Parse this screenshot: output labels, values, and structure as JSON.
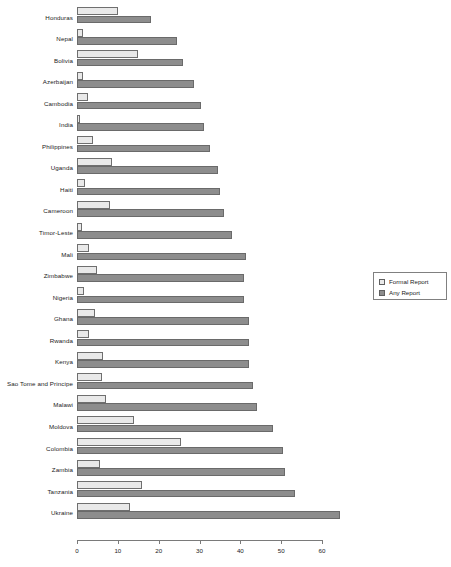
{
  "chart_data": {
    "type": "bar",
    "orientation": "horizontal",
    "title": "",
    "subtitle": "",
    "xlabel": "",
    "ylabel": "",
    "xlim": [
      0,
      65
    ],
    "xticks": [
      0,
      10,
      20,
      30,
      40,
      50,
      60
    ],
    "xtick_labels": [
      "0",
      "10",
      "20",
      "30",
      "40",
      "50",
      "60"
    ],
    "grid": false,
    "legend_position": "right-middle",
    "categories": [
      "Honduras",
      "Nepal",
      "Bolivia",
      "Azerbaijan",
      "Cambodia",
      "India",
      "Philippines",
      "Uganda",
      "Haiti",
      "Cameroon",
      "Timor-Leste",
      "Mali",
      "Zimbabwe",
      "Nigeria",
      "Ghana",
      "Rwanda",
      "Kenya",
      "Sao Tome and Principe",
      "Malawi",
      "Moldova",
      "Colombia",
      "Zambia",
      "Tanzania",
      "Ukraine"
    ],
    "series": [
      {
        "name": "Formal Report",
        "color": "#e9e9e9",
        "values": [
          10,
          1.5,
          15,
          1.5,
          2.7,
          0.8,
          4,
          8.6,
          2,
          8,
          1.2,
          3,
          5,
          1.7,
          4.4,
          3,
          6.4,
          6,
          7,
          14,
          25.5,
          5.6,
          16,
          13
        ]
      },
      {
        "name": "Any Report",
        "color": "#8d8d8d",
        "values": [
          18,
          24.5,
          26,
          28.6,
          30.4,
          31,
          32.6,
          34.5,
          35,
          36,
          38,
          41.4,
          41,
          41,
          42,
          42,
          42.2,
          43,
          44,
          48,
          50.5,
          51,
          53.4,
          64.5
        ]
      }
    ]
  },
  "legend": {
    "items": [
      {
        "label": "Formal Report",
        "swatch": "light-gray-square"
      },
      {
        "label": "Any Report",
        "swatch": "dark-gray-square"
      }
    ]
  }
}
